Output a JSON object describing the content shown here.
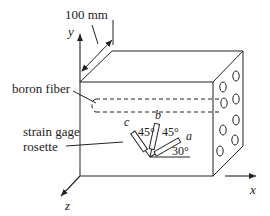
{
  "figure": {
    "type": "engineering-diagram"
  },
  "labels": {
    "dimension": "100 mm",
    "fiber": "boron fiber",
    "rosette_line1": "strain gage",
    "rosette_line2": "rosette"
  },
  "axes": {
    "x": "x",
    "y": "y",
    "z": "z"
  },
  "gages": {
    "a": "a",
    "b": "b",
    "c": "c"
  },
  "angles": {
    "cb": "45°",
    "ba": "45°",
    "a_from_x": "30°"
  },
  "colors": {
    "line": "#222222",
    "background": "#ffffff"
  }
}
